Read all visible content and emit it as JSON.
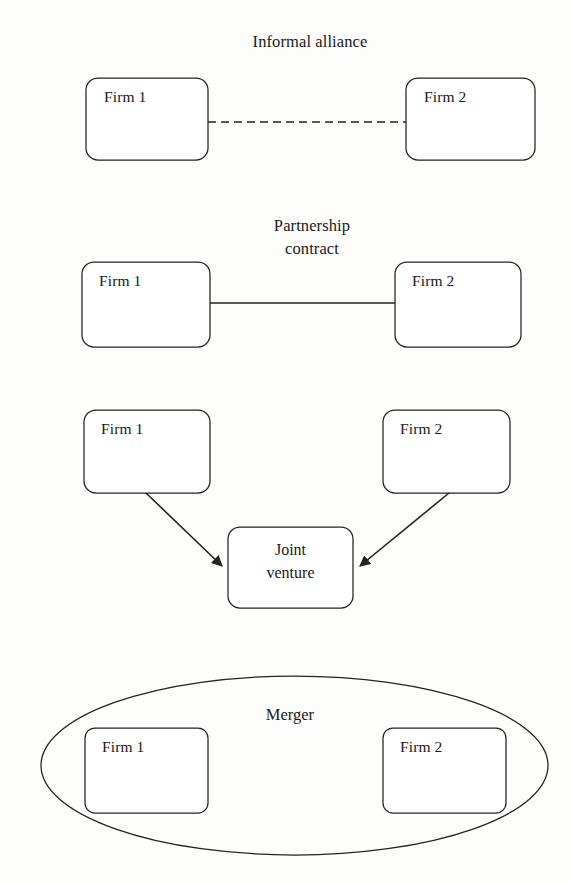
{
  "figure": {
    "background_color": "#fdfdfc",
    "ink_color": "#232323"
  },
  "panels": [
    {
      "id": "informal-alliance",
      "title": "Informal alliance",
      "title_lines": [
        "Informal alliance"
      ],
      "link_style": "dashed",
      "nodes": [
        {
          "id": "firm-1",
          "label": "Firm 1"
        },
        {
          "id": "firm-2",
          "label": "Firm 2"
        }
      ]
    },
    {
      "id": "partnership-contract",
      "title": "Partnership contract",
      "title_lines": [
        "Partnership",
        "contract"
      ],
      "link_style": "solid",
      "nodes": [
        {
          "id": "firm-1",
          "label": "Firm 1"
        },
        {
          "id": "firm-2",
          "label": "Firm 2"
        }
      ]
    },
    {
      "id": "joint-venture",
      "title": "",
      "title_lines": [],
      "link_style": "arrows",
      "nodes": [
        {
          "id": "firm-1",
          "label": "Firm 1"
        },
        {
          "id": "firm-2",
          "label": "Firm 2"
        }
      ],
      "shared_node": {
        "id": "joint-venture-node",
        "label": "Joint venture",
        "label_lines": [
          "Joint",
          "venture"
        ]
      }
    },
    {
      "id": "merger",
      "title": "Merger",
      "title_lines": [
        "Merger"
      ],
      "link_style": "enclosure",
      "enclosure_shape": "ellipse",
      "nodes": [
        {
          "id": "firm-1",
          "label": "Firm 1"
        },
        {
          "id": "firm-2",
          "label": "Firm 2"
        }
      ]
    }
  ],
  "labels": {
    "p1_title": "Informal alliance",
    "p1_firm1": "Firm 1",
    "p1_firm2": "Firm 2",
    "p2_title_line1": "Partnership",
    "p2_title_line2": "contract",
    "p2_firm1": "Firm 1",
    "p2_firm2": "Firm 2",
    "p3_firm1": "Firm 1",
    "p3_firm2": "Firm 2",
    "p3_jv_line1": "Joint",
    "p3_jv_line2": "venture",
    "p4_title": "Merger",
    "p4_firm1": "Firm 1",
    "p4_firm2": "Firm 2"
  }
}
